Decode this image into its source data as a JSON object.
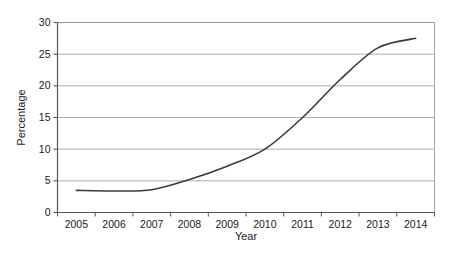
{
  "chart_data": {
    "type": "line",
    "title": "",
    "xlabel": "Year",
    "ylabel": "Percentage",
    "categories": [
      "2005",
      "2006",
      "2007",
      "2008",
      "2009",
      "2010",
      "2011",
      "2012",
      "2013",
      "2014"
    ],
    "x": [
      2005,
      2006,
      2007,
      2008,
      2009,
      2010,
      2011,
      2012,
      2013,
      2014
    ],
    "values": [
      3.5,
      3.4,
      3.6,
      5.2,
      7.3,
      10.0,
      15.0,
      21.0,
      26.0,
      27.5
    ],
    "series": [
      {
        "name": "Percentage",
        "values": [
          3.5,
          3.4,
          3.6,
          5.2,
          7.3,
          10.0,
          15.0,
          21.0,
          26.0,
          27.5
        ]
      }
    ],
    "xlim": [
      2004.5,
      2014.5
    ],
    "ylim": [
      0,
      30
    ],
    "yticks": [
      0,
      5,
      10,
      15,
      20,
      25,
      30
    ],
    "ytick_labels": [
      "0",
      "5",
      "10",
      "15",
      "20",
      "25",
      "30"
    ],
    "xtick_labels": [
      "2005",
      "2006",
      "2007",
      "2008",
      "2009",
      "2010",
      "2011",
      "2012",
      "2013",
      "2014"
    ],
    "grid": "horizontal",
    "legend": "none",
    "line_color": "#3a3a3a",
    "grid_color": "#9a9a9a",
    "axis_color": "#555555",
    "background_color": "#ffffff"
  }
}
